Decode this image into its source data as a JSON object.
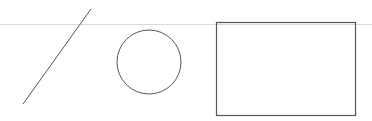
{
  "canvas": {
    "width": 372,
    "height": 121,
    "background": "#ffffff"
  },
  "guide_line": {
    "y": 24,
    "x1": 0,
    "x2": 372,
    "color": "#d9d9d9"
  },
  "shapes": {
    "line": {
      "x1": 91,
      "y1": 9,
      "x2": 23,
      "y2": 104,
      "color": "#555555",
      "stroke_width": 1
    },
    "circle": {
      "cx": 149,
      "cy": 62,
      "r": 32,
      "color": "#555555",
      "stroke_width": 1
    },
    "rectangle": {
      "x": 216,
      "y": 22,
      "width": 139,
      "height": 93,
      "color": "#555555",
      "stroke_width": 1.2
    }
  }
}
